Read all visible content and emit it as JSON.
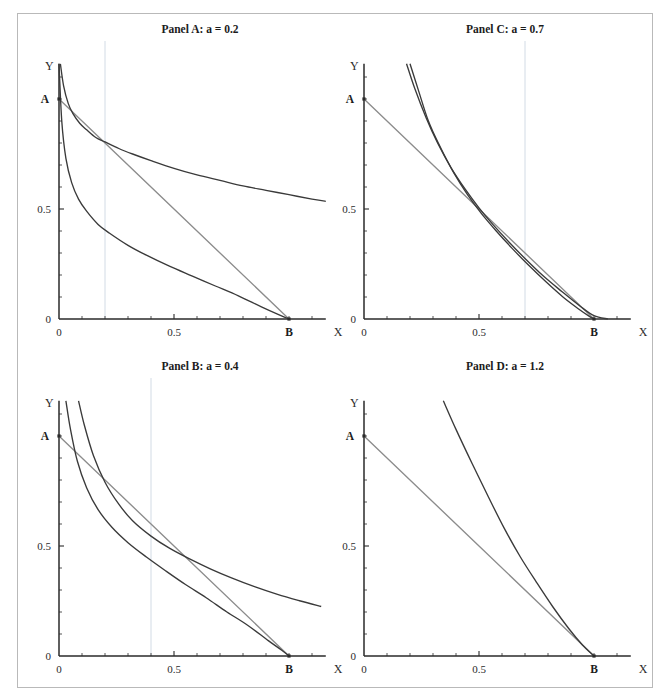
{
  "figure": {
    "title": "",
    "panel_count": 4
  },
  "axes": {
    "x_label": "X",
    "y_label": "Y",
    "tick_labels_x": [
      "0",
      "0.5"
    ],
    "tick_labels_y": [
      "0",
      "0.5"
    ],
    "point_a_label": "A",
    "point_b_label": "B",
    "x_range": [
      0,
      1.16
    ],
    "y_range": [
      0,
      1.16
    ],
    "x_ticks_major": [
      0,
      0.5
    ],
    "y_ticks_major": [
      0,
      0.5
    ],
    "minor_tick_step": 0.1,
    "grid": "single vertical gridline at x = a",
    "colors": {
      "curve": "#3a3a3a",
      "budget": "#8c8c8c",
      "axis": "#2a2a2a",
      "gridline": "#cdd7e2",
      "frame": "#b9b9b9"
    }
  },
  "chart_data": [
    {
      "type": "line",
      "title": "Panel A: a = 0.2",
      "panel_id": "A",
      "parameter_a": 0.2,
      "xlabel": "X",
      "ylabel": "Y",
      "xlim": [
        0,
        1.16
      ],
      "ylim": [
        0,
        1.16
      ],
      "xticks": [
        0,
        0.5
      ],
      "yticks": [
        0,
        0.5
      ],
      "xticklabels": [
        "0",
        "0.5"
      ],
      "yticklabels": [
        "0",
        "0.5"
      ],
      "annotations": [
        {
          "label": "A",
          "x": 0,
          "y": 1.0
        },
        {
          "label": "B",
          "x": 1.0,
          "y": 0
        }
      ],
      "gridlines_x": [
        0.2
      ],
      "series": [
        {
          "name": "budget-line",
          "style": "straight",
          "color": "#8c8c8c",
          "x": [
            0,
            1.0
          ],
          "values": [
            1.0,
            0
          ]
        },
        {
          "name": "upper-curve",
          "style": "curve",
          "color": "#3a3a3a",
          "x": [
            0.006,
            0.02,
            0.04,
            0.06,
            0.09,
            0.12,
            0.16,
            0.2,
            0.26,
            0.32,
            0.4,
            0.5,
            0.6,
            0.7,
            0.8,
            0.9,
            1.0,
            1.1,
            1.16
          ],
          "values": [
            1.16,
            1.06,
            0.98,
            0.935,
            0.89,
            0.86,
            0.825,
            0.805,
            0.775,
            0.75,
            0.72,
            0.685,
            0.655,
            0.63,
            0.605,
            0.585,
            0.565,
            0.545,
            0.535
          ]
        },
        {
          "name": "lower-curve",
          "style": "curve",
          "color": "#3a3a3a",
          "x": [
            0.0,
            0.012,
            0.03,
            0.055,
            0.085,
            0.12,
            0.17,
            0.22,
            0.3,
            0.38,
            0.48,
            0.58,
            0.68,
            0.78,
            0.88,
            0.95,
            1.0
          ],
          "values": [
            1.16,
            0.9,
            0.73,
            0.62,
            0.545,
            0.49,
            0.43,
            0.39,
            0.335,
            0.29,
            0.24,
            0.195,
            0.15,
            0.105,
            0.055,
            0.022,
            0.0
          ]
        }
      ]
    },
    {
      "type": "line",
      "title": "Panel C: a = 0.7",
      "panel_id": "C",
      "parameter_a": 0.7,
      "xlabel": "X",
      "ylabel": "Y",
      "xlim": [
        0,
        1.16
      ],
      "ylim": [
        0,
        1.16
      ],
      "xticks": [
        0,
        0.5
      ],
      "yticks": [
        0,
        0.5
      ],
      "xticklabels": [
        "0",
        "0.5"
      ],
      "yticklabels": [
        "0",
        "0.5"
      ],
      "annotations": [
        {
          "label": "A",
          "x": 0,
          "y": 1.0
        },
        {
          "label": "B",
          "x": 1.0,
          "y": 0
        }
      ],
      "gridlines_x": [
        0.7
      ],
      "series": [
        {
          "name": "budget-line",
          "style": "straight",
          "color": "#8c8c8c",
          "x": [
            0,
            1.0
          ],
          "values": [
            1.0,
            0
          ]
        },
        {
          "name": "upper-curve",
          "style": "curve",
          "color": "#3a3a3a",
          "x": [
            0.185,
            0.22,
            0.27,
            0.32,
            0.38,
            0.44,
            0.5,
            0.56,
            0.63,
            0.7,
            0.78,
            0.86,
            0.94,
            1.0,
            1.06
          ],
          "values": [
            1.16,
            1.05,
            0.915,
            0.8,
            0.685,
            0.59,
            0.505,
            0.43,
            0.35,
            0.275,
            0.195,
            0.125,
            0.058,
            0.015,
            0.0
          ]
        },
        {
          "name": "lower-curve",
          "style": "curve",
          "color": "#3a3a3a",
          "x": [
            0.2,
            0.235,
            0.28,
            0.33,
            0.39,
            0.45,
            0.51,
            0.575,
            0.645,
            0.715,
            0.79,
            0.865,
            0.93,
            0.98,
            1.0
          ],
          "values": [
            1.16,
            1.045,
            0.9,
            0.785,
            0.665,
            0.565,
            0.48,
            0.4,
            0.32,
            0.245,
            0.17,
            0.1,
            0.048,
            0.012,
            0.0
          ]
        }
      ]
    },
    {
      "type": "line",
      "title": "Panel B: a = 0.4",
      "panel_id": "B",
      "parameter_a": 0.4,
      "xlabel": "X",
      "ylabel": "Y",
      "xlim": [
        0,
        1.16
      ],
      "ylim": [
        0,
        1.16
      ],
      "xticks": [
        0,
        0.5
      ],
      "yticks": [
        0,
        0.5
      ],
      "xticklabels": [
        "0",
        "0.5"
      ],
      "yticklabels": [
        "0",
        "0.5"
      ],
      "annotations": [
        {
          "label": "A",
          "x": 0,
          "y": 1.0
        },
        {
          "label": "B",
          "x": 1.0,
          "y": 0
        }
      ],
      "gridlines_x": [
        0.4
      ],
      "series": [
        {
          "name": "budget-line",
          "style": "straight",
          "color": "#8c8c8c",
          "x": [
            0,
            1.0
          ],
          "values": [
            1.0,
            0
          ]
        },
        {
          "name": "upper-curve",
          "style": "curve",
          "color": "#3a3a3a",
          "x": [
            0.085,
            0.11,
            0.15,
            0.2,
            0.26,
            0.32,
            0.4,
            0.48,
            0.57,
            0.66,
            0.75,
            0.85,
            0.95,
            1.05,
            1.14
          ],
          "values": [
            1.16,
            1.05,
            0.91,
            0.79,
            0.69,
            0.615,
            0.545,
            0.49,
            0.44,
            0.395,
            0.355,
            0.315,
            0.28,
            0.25,
            0.225
          ]
        },
        {
          "name": "lower-curve",
          "style": "curve",
          "color": "#3a3a3a",
          "x": [
            0.03,
            0.05,
            0.08,
            0.12,
            0.17,
            0.23,
            0.3,
            0.38,
            0.46,
            0.55,
            0.64,
            0.73,
            0.82,
            0.91,
            0.97,
            1.0
          ],
          "values": [
            1.16,
            1.03,
            0.885,
            0.765,
            0.665,
            0.585,
            0.515,
            0.45,
            0.39,
            0.325,
            0.265,
            0.2,
            0.14,
            0.07,
            0.025,
            0.0
          ]
        }
      ]
    },
    {
      "type": "line",
      "title": "Panel D: a = 1.2",
      "panel_id": "D",
      "parameter_a": 1.2,
      "xlabel": "X",
      "ylabel": "Y",
      "xlim": [
        0,
        1.16
      ],
      "ylim": [
        0,
        1.16
      ],
      "xticks": [
        0,
        0.5
      ],
      "yticks": [
        0,
        0.5
      ],
      "xticklabels": [
        "0",
        "0.5"
      ],
      "yticklabels": [
        "0",
        "0.5"
      ],
      "annotations": [
        {
          "label": "A",
          "x": 0,
          "y": 1.0
        },
        {
          "label": "B",
          "x": 1.0,
          "y": 0
        }
      ],
      "gridlines_x": [],
      "series": [
        {
          "name": "budget-line",
          "style": "straight",
          "color": "#8c8c8c",
          "x": [
            0,
            1.0
          ],
          "values": [
            1.0,
            0
          ]
        },
        {
          "name": "upper-curve",
          "style": "curve",
          "color": "#3a3a3a",
          "x": [
            0.345,
            0.4,
            0.47,
            0.54,
            0.61,
            0.68,
            0.75,
            0.82,
            0.89,
            0.95,
            1.0
          ],
          "values": [
            1.16,
            1.03,
            0.875,
            0.725,
            0.58,
            0.45,
            0.335,
            0.225,
            0.125,
            0.05,
            0.0
          ]
        }
      ]
    }
  ]
}
